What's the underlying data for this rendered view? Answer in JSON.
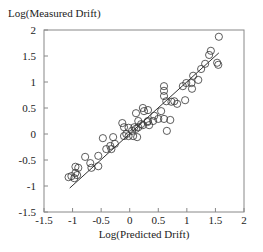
{
  "chart_data": {
    "type": "scatter",
    "title": "",
    "xlabel": "Log(Predicted Drift)",
    "ylabel": "Log(Measured Drift)",
    "xlim": [
      -1.5,
      2
    ],
    "ylim": [
      -1.5,
      2
    ],
    "xticks": [
      -1.5,
      -1,
      -0.5,
      0,
      0.5,
      1,
      1.5,
      2
    ],
    "yticks": [
      -1.5,
      -1,
      -0.5,
      0,
      0.5,
      1,
      1.5,
      2
    ],
    "xtick_labels": [
      "-1.5",
      "-1",
      "-0.5",
      "0",
      "0.5",
      "1",
      "1.5",
      "2"
    ],
    "ytick_labels": [
      "-1.5",
      "-1",
      "-0.5",
      "0",
      "0.5",
      "1",
      "1.5",
      "2"
    ],
    "grid": false,
    "legend": null,
    "fit_line": {
      "x": [
        -1.05,
        1.56
      ],
      "y": [
        -1.04,
        1.56
      ],
      "label": "y = x"
    },
    "series": [
      {
        "name": "measurements",
        "marker": "open-circle",
        "points": [
          [
            1.56,
            1.87
          ],
          [
            1.42,
            1.6
          ],
          [
            1.39,
            1.52
          ],
          [
            1.53,
            1.37
          ],
          [
            1.55,
            1.33
          ],
          [
            1.32,
            1.35
          ],
          [
            1.25,
            1.25
          ],
          [
            1.11,
            1.12
          ],
          [
            1.2,
            1.04
          ],
          [
            0.99,
            0.98
          ],
          [
            1.08,
            0.98
          ],
          [
            1.09,
            0.87
          ],
          [
            0.93,
            0.92
          ],
          [
            0.6,
            0.92
          ],
          [
            0.6,
            0.83
          ],
          [
            0.6,
            0.73
          ],
          [
            0.64,
            0.63
          ],
          [
            0.73,
            0.62
          ],
          [
            0.78,
            0.63
          ],
          [
            0.83,
            0.58
          ],
          [
            0.97,
            0.65
          ],
          [
            0.55,
            0.44
          ],
          [
            0.23,
            0.5
          ],
          [
            0.25,
            0.44
          ],
          [
            0.32,
            0.46
          ],
          [
            0.11,
            0.4
          ],
          [
            0.43,
            0.35
          ],
          [
            0.5,
            0.29
          ],
          [
            0.6,
            0.29
          ],
          [
            0.71,
            0.27
          ],
          [
            0.41,
            0.25
          ],
          [
            0.32,
            0.25
          ],
          [
            0.15,
            0.25
          ],
          [
            0.2,
            0.19
          ],
          [
            -0.13,
            0.21
          ],
          [
            0.11,
            0.1
          ],
          [
            0.08,
            0.13
          ],
          [
            0.65,
            0.06
          ],
          [
            -0.1,
            0.13
          ],
          [
            -0.02,
            0.12
          ],
          [
            0.15,
            0.13
          ],
          [
            0.23,
            0.17
          ],
          [
            0.34,
            0.17
          ],
          [
            0.31,
            0.23
          ],
          [
            -0.1,
            -0.04
          ],
          [
            -0.02,
            -0.04
          ],
          [
            0.06,
            -0.04
          ],
          [
            0.13,
            -0.06
          ],
          [
            -0.06,
            0.0
          ],
          [
            0.04,
            0.06
          ],
          [
            -0.47,
            -0.08
          ],
          [
            -0.29,
            -0.06
          ],
          [
            -0.34,
            -0.23
          ],
          [
            -0.26,
            -0.19
          ],
          [
            -0.41,
            -0.29
          ],
          [
            -0.32,
            -0.29
          ],
          [
            -0.55,
            -0.42
          ],
          [
            -0.78,
            -0.44
          ],
          [
            -0.69,
            -0.56
          ],
          [
            -0.55,
            -0.62
          ],
          [
            -0.67,
            -0.65
          ],
          [
            -0.95,
            -0.63
          ],
          [
            -0.9,
            -0.65
          ],
          [
            -0.95,
            -0.75
          ],
          [
            -1.07,
            -0.83
          ],
          [
            -1.02,
            -0.81
          ],
          [
            -0.97,
            -0.85
          ],
          [
            -0.92,
            -0.79
          ]
        ]
      }
    ]
  }
}
